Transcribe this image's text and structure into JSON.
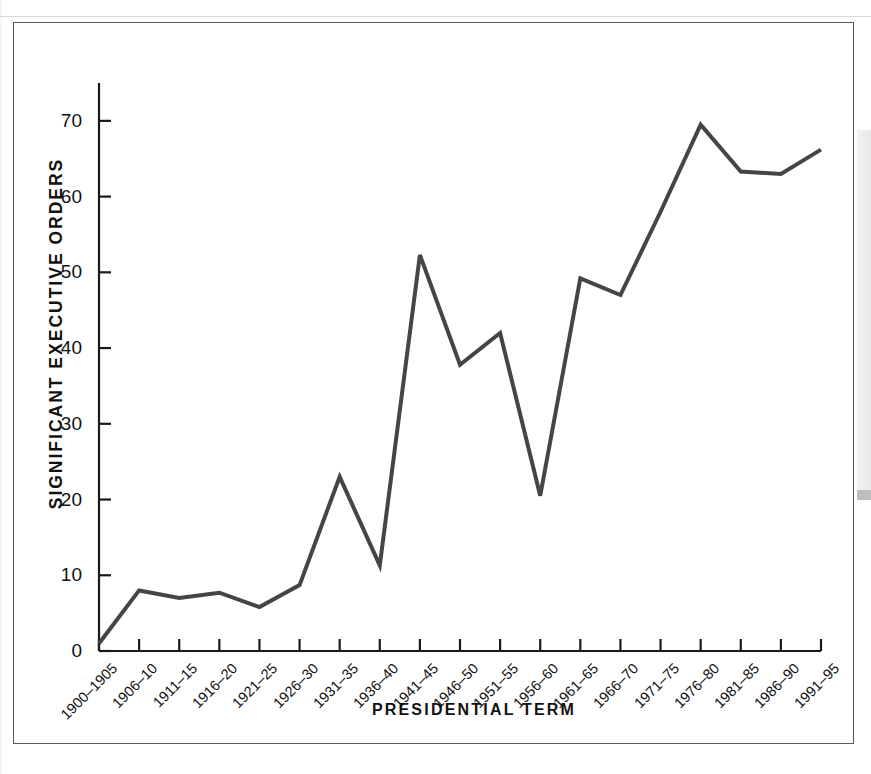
{
  "figure": {
    "frame_color": "#5a5a5a",
    "background": "#ffffff"
  },
  "chart_data": {
    "type": "line",
    "title": "",
    "xlabel": "PRESIDENTIAL TERM",
    "ylabel": "SIGNIFICANT EXECUTIVE ORDERS",
    "ylim": [
      0,
      75
    ],
    "yticks": [
      0,
      10,
      20,
      30,
      40,
      50,
      60,
      70
    ],
    "ytick_labels": [
      "0",
      "10",
      "20",
      "30",
      "40",
      "50",
      "60",
      "70"
    ],
    "grid": false,
    "legend": null,
    "line_color": "#454545",
    "line_width": 4,
    "categories": [
      "1900–1905",
      "1906–10",
      "1911–15",
      "1916–20",
      "1921–25",
      "1926–30",
      "1931–35",
      "1936–40",
      "1941–45",
      "1946–50",
      "1951–55",
      "1956–60",
      "1961–65",
      "1966–70",
      "1971–75",
      "1976–80",
      "1981–85",
      "1986–90",
      "1991–95"
    ],
    "values": [
      1.0,
      8.0,
      7.0,
      7.7,
      5.8,
      8.7,
      23.0,
      11.3,
      52.3,
      37.8,
      42.0,
      20.5,
      49.2,
      47.0,
      58.0,
      69.5,
      63.3,
      63.0,
      66.2
    ],
    "series": [
      {
        "name": "Significant Executive Orders",
        "values": [
          1.0,
          8.0,
          7.0,
          7.7,
          5.8,
          8.7,
          23.0,
          11.3,
          52.3,
          37.8,
          42.0,
          20.5,
          49.2,
          47.0,
          58.0,
          69.5,
          63.3,
          63.0,
          66.2
        ]
      }
    ]
  }
}
